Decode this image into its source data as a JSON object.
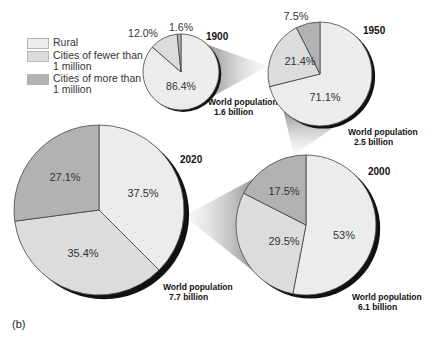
{
  "chart_data": {
    "type": "pie",
    "panel_label": "(b)",
    "legend": [
      {
        "key": "rural",
        "label": "Rural",
        "color": "#ececec"
      },
      {
        "key": "small",
        "label": "Cities of fewer than\n1 million",
        "color": "#dcdcdc"
      },
      {
        "key": "large",
        "label": "Cities of more than\n1 million",
        "color": "#b2b2b2"
      }
    ],
    "categories": [
      "Rural",
      "Cities of fewer than 1 million",
      "Cities of more than 1 million"
    ],
    "pies": [
      {
        "year": "1900",
        "population_label": "World population",
        "population_value": "1.6 billion",
        "values": {
          "rural": 86.4,
          "small": 12.0,
          "large": 1.6
        },
        "labels": {
          "rural": "86.4%",
          "small": "12.0%",
          "large": "1.6%"
        }
      },
      {
        "year": "1950",
        "population_label": "World population",
        "population_value": "2.5 billion",
        "values": {
          "rural": 71.1,
          "small": 21.4,
          "large": 7.5
        },
        "labels": {
          "rural": "71.1%",
          "small": "21.4%",
          "large": "7.5%"
        }
      },
      {
        "year": "2000",
        "population_label": "World population",
        "population_value": "6.1 billion",
        "values": {
          "rural": 53,
          "small": 29.5,
          "large": 17.5
        },
        "labels": {
          "rural": "53%",
          "small": "29.5%",
          "large": "17.5%"
        }
      },
      {
        "year": "2020",
        "population_label": "World population",
        "population_value": "7.7 billion",
        "values": {
          "rural": 37.5,
          "small": 35.4,
          "large": 27.1
        },
        "labels": {
          "rural": "37.5%",
          "small": "35.4%",
          "large": "27.1%"
        }
      }
    ]
  },
  "layout": {
    "pies": [
      {
        "cx": 181,
        "cy": 72,
        "r": 38,
        "year_xy": [
          206,
          40
        ],
        "pop_xy": [
          208,
          105
        ],
        "labels_xy": {
          "rural": [
            181,
            90
          ],
          "small": [
            143,
            37
          ],
          "large": [
            181,
            31
          ]
        },
        "outside": {
          "small": true,
          "large": true
        }
      },
      {
        "cx": 320,
        "cy": 74,
        "r": 52,
        "year_xy": [
          363,
          34
        ],
        "pop_xy": [
          348,
          135
        ],
        "labels_xy": {
          "rural": [
            325,
            101
          ],
          "small": [
            300,
            65
          ],
          "large": [
            296,
            20
          ]
        },
        "outside": {
          "large": true
        }
      },
      {
        "cx": 306,
        "cy": 225,
        "r": 70,
        "year_xy": [
          368,
          175
        ],
        "pop_xy": [
          352,
          300
        ],
        "labels_xy": {
          "rural": [
            344,
            239
          ],
          "small": [
            284,
            245
          ],
          "large": [
            284,
            195
          ]
        }
      },
      {
        "cx": 99,
        "cy": 210,
        "r": 85,
        "year_xy": [
          180,
          163
        ],
        "pop_xy": [
          163,
          290
        ],
        "labels_xy": {
          "rural": [
            143,
            197
          ],
          "small": [
            83,
            257
          ],
          "large": [
            65,
            181
          ]
        }
      }
    ],
    "funnels": [
      {
        "from": 0,
        "to": 1
      },
      {
        "from": 1,
        "to": 2
      },
      {
        "from": 2,
        "to": 3
      }
    ]
  }
}
